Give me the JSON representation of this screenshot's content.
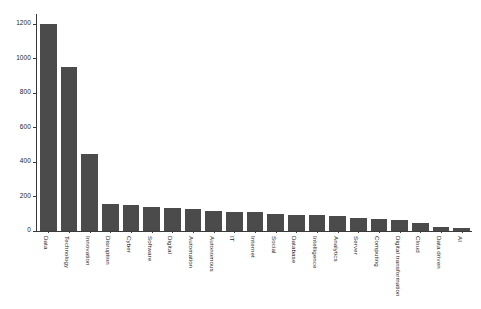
{
  "chart_data": {
    "type": "bar",
    "title": "",
    "subtitle": "",
    "xlabel": "",
    "ylabel": "",
    "ylim": [
      0,
      1260
    ],
    "yticks": [
      0,
      200,
      400,
      600,
      800,
      1000,
      1200
    ],
    "ytick_labels": [
      "0",
      "200",
      "400",
      "600",
      "800",
      "1000",
      "1200"
    ],
    "grid": false,
    "legend": null,
    "bar_color": "#4b4b4b",
    "axis_color": "#3a3a3a",
    "background_color": "#ffffff",
    "categories": [
      "Data",
      "Technology",
      "Innovation",
      "Disruption",
      "Cyber",
      "Software",
      "Digital",
      "Automation",
      "Autonomous",
      "IT",
      "Internet",
      "Social",
      "Database",
      "Intelligence",
      "Analytics",
      "Server",
      "Computing",
      "Digital transformation",
      "Cloud",
      "Data driven",
      "AI"
    ],
    "values": [
      1200,
      952,
      450,
      155,
      150,
      140,
      132,
      125,
      115,
      112,
      110,
      98,
      95,
      92,
      85,
      78,
      72,
      62,
      48,
      25,
      18
    ]
  }
}
